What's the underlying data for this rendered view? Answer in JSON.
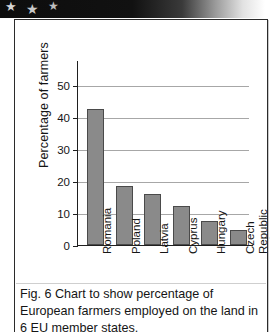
{
  "banner": {
    "stars": [
      "★",
      "★",
      "★"
    ],
    "star_icon_name": "star-icon"
  },
  "figure": {
    "caption": "Fig. 6 Chart to show percentage of European farmers employed on the land in 6 EU member states."
  },
  "chart_data": {
    "type": "bar",
    "title": "",
    "xlabel": "",
    "ylabel": "Percentage of farmers",
    "categories": [
      "Romania",
      "Poland",
      "Latvia",
      "Cyprus",
      "Hungary",
      "Czech Republic"
    ],
    "category_lines": [
      [
        "Romania"
      ],
      [
        "Poland"
      ],
      [
        "Latvia"
      ],
      [
        "Cyprus"
      ],
      [
        "Hungary"
      ],
      [
        "Czech",
        "Republic"
      ]
    ],
    "values": [
      42.5,
      18.5,
      16.0,
      12.3,
      7.5,
      4.8
    ],
    "ylim": [
      0,
      55
    ],
    "yticks": [
      50,
      40,
      30,
      20,
      10,
      0
    ],
    "ytick_labels": [
      "50",
      "40",
      "30",
      "20",
      "10",
      "0"
    ],
    "grid": true,
    "legend": false,
    "bar_color": "#8a8a8a",
    "bar_border_color": "#4a4a4a",
    "gridline_color": "#a7a7a7",
    "axis_color": "#1f1f1f"
  }
}
